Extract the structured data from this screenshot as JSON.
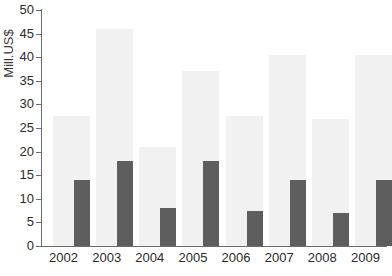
{
  "chart_data": {
    "type": "bar",
    "title": "",
    "xlabel": "",
    "ylabel": "Mill.US$",
    "categories": [
      "2002",
      "2003",
      "2004",
      "2005",
      "2006",
      "2007",
      "2008",
      "2009"
    ],
    "series": [
      {
        "name": "light-series",
        "color": "#f1f1f1",
        "values": [
          27.5,
          46,
          21,
          37,
          27.5,
          40.5,
          27,
          40.5
        ]
      },
      {
        "name": "dark-series",
        "color": "#5e5e5e",
        "values": [
          14,
          18,
          8,
          18,
          7.5,
          14,
          7,
          14
        ]
      }
    ],
    "ylim": [
      0,
      50
    ],
    "ytick_step": 5,
    "yticks": [
      "0",
      "5",
      "10",
      "15",
      "20",
      "25",
      "30",
      "35",
      "40",
      "45",
      "50"
    ],
    "grid": false,
    "legend": "none",
    "axis_color": "#6b6b6b",
    "text_color": "#2b2b2b"
  }
}
